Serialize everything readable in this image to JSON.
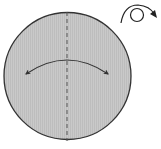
{
  "diagram": {
    "type": "origami-fold-step",
    "paper": {
      "shape": "circle",
      "fill": "#c8c8c8",
      "stroke": "#333333"
    },
    "fold_line": {
      "style": "dashed",
      "orientation": "vertical",
      "color": "#555555"
    },
    "fold_arrow": {
      "kind": "double-headed-curved",
      "color": "#333333"
    },
    "turn_over_icon": {
      "kind": "turn-over",
      "color": "#222222"
    }
  }
}
